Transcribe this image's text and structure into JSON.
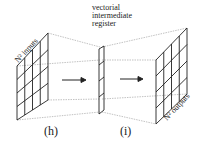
{
  "diagram": {
    "left_panel": {
      "label": "N² inputs",
      "grid": "4x4"
    },
    "middle": {
      "label_lines": [
        "vectorial",
        "intermediate",
        "register"
      ],
      "cells": 4
    },
    "right_panel": {
      "label": "N² outputs",
      "grid": "4x4"
    },
    "captions": {
      "h": "(h)",
      "i": "(i)"
    },
    "arrows": [
      "→",
      "→"
    ]
  }
}
